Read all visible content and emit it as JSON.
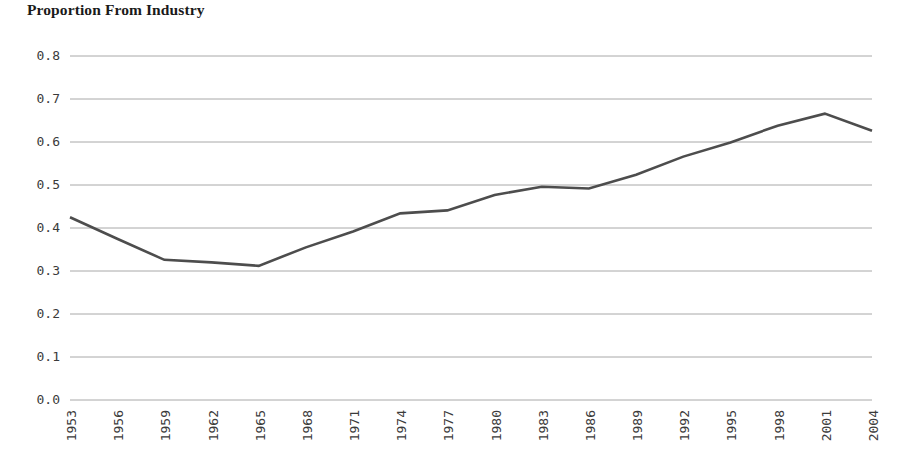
{
  "chart_data": {
    "type": "line",
    "title": "Proportion From Industry",
    "xlabel": "",
    "ylabel": "",
    "grid": "horizontal",
    "legend": "none",
    "ylim": [
      0.0,
      0.8
    ],
    "xlim": [
      1953,
      2004
    ],
    "y_ticks": [
      "0.0",
      "0.1",
      "0.2",
      "0.3",
      "0.4",
      "0.5",
      "0.6",
      "0.7",
      "0.8"
    ],
    "y_tick_values": [
      0.0,
      0.1,
      0.2,
      0.3,
      0.4,
      0.5,
      0.6,
      0.7,
      0.8
    ],
    "x_ticks": [
      "1953",
      "1956",
      "1959",
      "1962",
      "1965",
      "1968",
      "1971",
      "1974",
      "1977",
      "1980",
      "1983",
      "1986",
      "1989",
      "1992",
      "1995",
      "1998",
      "2001",
      "2004"
    ],
    "x_tick_values": [
      1953,
      1956,
      1959,
      1962,
      1965,
      1968,
      1971,
      1974,
      1977,
      1980,
      1983,
      1986,
      1989,
      1992,
      1995,
      1998,
      2001,
      2004
    ],
    "x": [
      1953,
      1956,
      1959,
      1962,
      1965,
      1968,
      1971,
      1974,
      1977,
      1980,
      1983,
      1986,
      1989,
      1992,
      1995,
      1998,
      2001,
      2004
    ],
    "values": [
      0.425,
      0.375,
      0.326,
      0.32,
      0.312,
      0.355,
      0.392,
      0.434,
      0.441,
      0.477,
      0.496,
      0.492,
      0.524,
      0.566,
      0.599,
      0.638,
      0.666,
      0.626
    ],
    "series": [
      {
        "name": "Proportion From Industry",
        "color": "#4d4d4d",
        "values": [
          0.425,
          0.375,
          0.326,
          0.32,
          0.312,
          0.355,
          0.392,
          0.434,
          0.441,
          0.477,
          0.496,
          0.492,
          0.524,
          0.566,
          0.599,
          0.638,
          0.666,
          0.626
        ]
      }
    ]
  },
  "style": {
    "line_color": "#4d4d4d",
    "grid_color": "#a8a8a8",
    "text_color": "#3b3b3b",
    "title_color": "#1a1a1a",
    "background": "#ffffff",
    "line_width": 2.6
  },
  "plot_geometry": {
    "left": 70,
    "right": 872,
    "top": 56,
    "bottom": 400,
    "tick_label_top": 410
  }
}
